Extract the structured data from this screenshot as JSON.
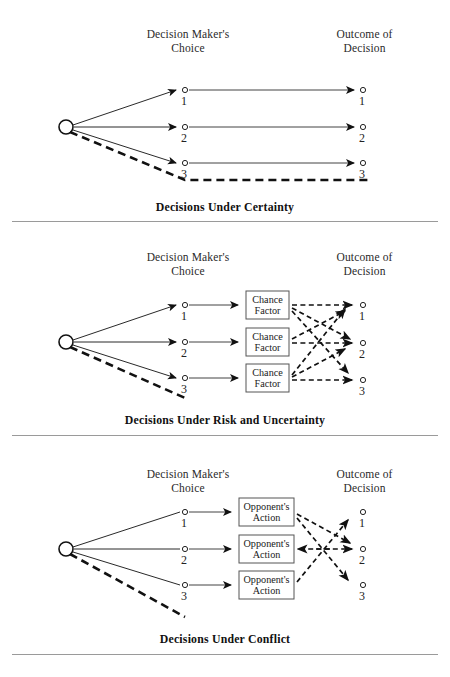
{
  "figure": {
    "column_headers": {
      "choice": "Decision Maker's\nChoice",
      "outcome": "Outcome of\nDecision"
    },
    "node_labels": [
      "1",
      "2",
      "3"
    ],
    "colors": {
      "ink": "#1a1a1a",
      "rule": "#9a9a9a",
      "background": "#ffffff"
    }
  },
  "panels": [
    {
      "id": "certainty",
      "caption": "Decisions Under Certainty",
      "choice_nodes": [
        "1",
        "2",
        "3"
      ],
      "outcome_nodes": [
        "1",
        "2",
        "3"
      ],
      "middle_boxes": [],
      "mapping_note": "each choice leads with certainty to the matching outcome",
      "links": [
        {
          "from": "choice-1",
          "to": "outcome-1",
          "style": "solid"
        },
        {
          "from": "choice-2",
          "to": "outcome-2",
          "style": "solid"
        },
        {
          "from": "choice-3",
          "to": "outcome-3",
          "style": "solid"
        }
      ]
    },
    {
      "id": "risk-uncertainty",
      "caption": "Decisions Under Risk and Uncertainty",
      "choice_nodes": [
        "1",
        "2",
        "3"
      ],
      "outcome_nodes": [
        "1",
        "2",
        "3"
      ],
      "middle_boxes": [
        "Chance\nFactor",
        "Chance\nFactor",
        "Chance\nFactor"
      ],
      "box_label_line1": "Chance",
      "box_label_line2": "Factor",
      "mapping_note": "chance factors scramble the mapping from choice to outcome",
      "links": [
        {
          "from": "box-1",
          "to": "outcome-1",
          "style": "dashed"
        },
        {
          "from": "box-1",
          "to": "outcome-2",
          "style": "dashed"
        },
        {
          "from": "box-1",
          "to": "outcome-3",
          "style": "dashed"
        },
        {
          "from": "box-2",
          "to": "outcome-1",
          "style": "dashed"
        },
        {
          "from": "box-2",
          "to": "outcome-2",
          "style": "dashed"
        },
        {
          "from": "box-3",
          "to": "outcome-1",
          "style": "dashed"
        },
        {
          "from": "box-3",
          "to": "outcome-2",
          "style": "dashed"
        },
        {
          "from": "box-3",
          "to": "outcome-3",
          "style": "dashed"
        }
      ]
    },
    {
      "id": "conflict",
      "caption": "Decisions Under Conflict",
      "choice_nodes": [
        "1",
        "2",
        "3"
      ],
      "outcome_nodes": [
        "1",
        "2",
        "3"
      ],
      "middle_boxes": [
        "Opponent's\nAction",
        "Opponent's\nAction",
        "Opponent's\nAction"
      ],
      "box_label_line1": "Opponent's",
      "box_label_line2": "Action",
      "mapping_note": "opponent's actions redirect each choice to a different outcome",
      "links": [
        {
          "from": "box-1",
          "to": "outcome-2",
          "style": "dashed"
        },
        {
          "from": "box-1",
          "to": "outcome-3",
          "style": "dashed"
        },
        {
          "from": "box-2",
          "to": "outcome-2",
          "style": "dashed"
        },
        {
          "from": "box-3",
          "to": "outcome-1",
          "style": "dashed"
        },
        {
          "from": "outcome-2-left",
          "to": "box-2",
          "style": "dashed"
        }
      ]
    }
  ]
}
